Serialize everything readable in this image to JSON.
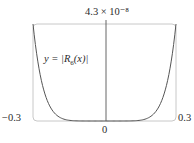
{
  "chart_data": {
    "type": "line",
    "title": "",
    "xlabel": "",
    "ylabel": "",
    "xlim": [
      -0.3,
      0.3
    ],
    "ylim": [
      0,
      4.3e-08
    ],
    "grid": false,
    "legend": null,
    "tick_labels": {
      "x_min": "−0.3",
      "x_max": "0.3",
      "x_zero": "0",
      "y_max": "4.3 × 10⁻⁸"
    },
    "annotations": [
      {
        "text": "y = |R6(x)|",
        "position": "upper-left inside plot"
      }
    ],
    "series": [
      {
        "name": "y = |R6(x)|",
        "x": [
          -0.3,
          -0.27,
          -0.24,
          -0.21,
          -0.18,
          -0.15,
          -0.12,
          -0.09,
          -0.06,
          -0.03,
          0,
          0.03,
          0.06,
          0.09,
          0.12,
          0.15,
          0.18,
          0.21,
          0.24,
          0.27,
          0.3
        ],
        "values": [
          4.3e-08,
          2.05e-08,
          9e-09,
          3.5e-09,
          1.2e-09,
          3.4e-10,
          7e-11,
          9.4e-12,
          6.7e-13,
          5.2e-15,
          0,
          5.2e-15,
          6.7e-13,
          9.4e-12,
          7e-11,
          3.4e-10,
          1.2e-09,
          3.5e-09,
          9e-09,
          2.05e-08,
          4.3e-08
        ]
      }
    ]
  },
  "labels": {
    "y_max": "4.3 × 10⁻⁸",
    "x_min": "−0.3",
    "x_max": "0.3",
    "x_zero": "0",
    "curve_prefix": "y = |",
    "curve_R": "R",
    "curve_sub": "6",
    "curve_arg": "(x)|"
  },
  "colors": {
    "frame": "#c8c8c8",
    "axis": "#555555",
    "curve": "#555555"
  }
}
